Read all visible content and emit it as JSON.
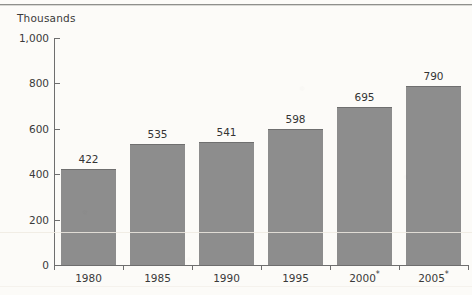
{
  "chart_data": {
    "type": "bar",
    "title": "",
    "subtitle": "",
    "xlabel": "",
    "ylabel": "Thousands",
    "categories": [
      "1980",
      "1985",
      "1990",
      "1995",
      "2000*",
      "2005*"
    ],
    "values": [
      422,
      535,
      541,
      598,
      695,
      790
    ],
    "data_labels": [
      "422",
      "535",
      "541",
      "598",
      "695",
      "790"
    ],
    "ylim": [
      0,
      1000
    ],
    "y_ticks": [
      0,
      200,
      400,
      600,
      800,
      1000
    ],
    "y_tick_labels": [
      "0",
      "200",
      "400",
      "600",
      "800",
      "1,000"
    ],
    "grid": false,
    "legend": null,
    "series": [
      {
        "name": "",
        "values": [
          422,
          535,
          541,
          598,
          695,
          790
        ],
        "color": "#8d8d8d"
      }
    ],
    "annotations": [
      {
        "category": "2000*",
        "marker": "*"
      },
      {
        "category": "2005*",
        "marker": "*"
      }
    ]
  },
  "axis": {
    "header_label": "Thousands",
    "category_labels": [
      {
        "base": "1980",
        "sup": ""
      },
      {
        "base": "1985",
        "sup": ""
      },
      {
        "base": "1990",
        "sup": ""
      },
      {
        "base": "1995",
        "sup": ""
      },
      {
        "base": "2000",
        "sup": "*"
      },
      {
        "base": "2005",
        "sup": "*"
      }
    ]
  },
  "colors": {
    "bar_fill": "#8d8d8d",
    "bar_top_edge": "#6f6f6f",
    "axis": "#6e6e6e",
    "text": "#3a3a3a",
    "background": "#fcfbf8"
  }
}
